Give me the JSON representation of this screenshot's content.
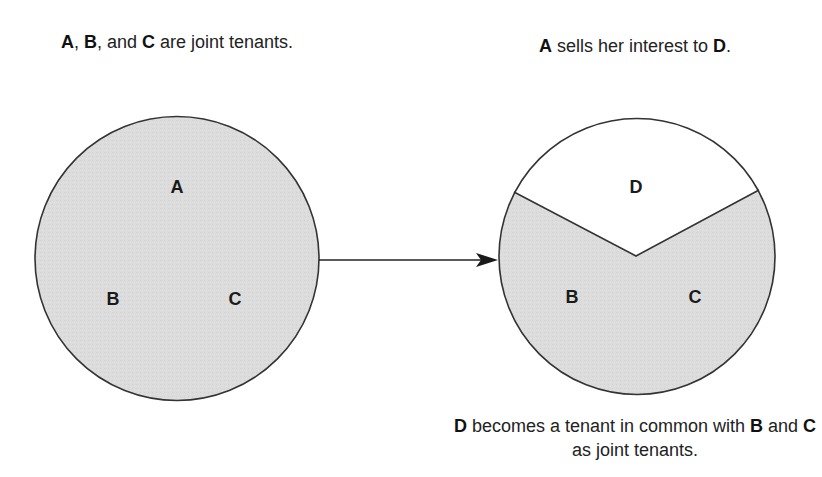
{
  "captions": {
    "left": {
      "parts": [
        {
          "text": "A",
          "bold": true
        },
        {
          "text": ", ",
          "bold": false
        },
        {
          "text": "B",
          "bold": true
        },
        {
          "text": ", and ",
          "bold": false
        },
        {
          "text": "C",
          "bold": true
        },
        {
          "text": " are joint tenants.",
          "bold": false
        }
      ]
    },
    "right": {
      "parts": [
        {
          "text": "A",
          "bold": true
        },
        {
          "text": " sells her interest to ",
          "bold": false
        },
        {
          "text": "D",
          "bold": true
        },
        {
          "text": ".",
          "bold": false
        }
      ]
    },
    "bottom": {
      "parts": [
        {
          "text": "D",
          "bold": true
        },
        {
          "text": " becomes a tenant in common with ",
          "bold": false
        },
        {
          "text": "B",
          "bold": true
        },
        {
          "text": " and ",
          "bold": false
        },
        {
          "text": "C",
          "bold": true
        },
        {
          "text": " as joint tenants.",
          "bold": false
        }
      ]
    }
  },
  "before": {
    "title": "Joint tenancy",
    "owners": [
      "A",
      "B",
      "C"
    ],
    "shared_region_label": "A, B, C joint tenancy"
  },
  "after": {
    "title": "After transfer",
    "tenant_in_common": "D",
    "joint_tenants": [
      "B",
      "C"
    ],
    "regions": [
      {
        "name": "D",
        "type": "tenant-in-common"
      },
      {
        "name": "B",
        "type": "joint-tenant"
      },
      {
        "name": "C",
        "type": "joint-tenant"
      }
    ]
  },
  "colors": {
    "shaded_fill": "#dcdcdc",
    "unshaded_fill": "#ffffff",
    "stroke": "#333333"
  }
}
